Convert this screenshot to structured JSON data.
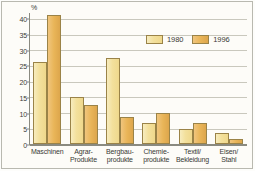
{
  "chart_data": {
    "type": "bar",
    "title": "",
    "xlabel": "",
    "ylabel": "%",
    "unit_label": "%",
    "ylim": [
      0,
      42
    ],
    "yticks": [
      0,
      5,
      10,
      15,
      20,
      25,
      30,
      35,
      40
    ],
    "ytick_labels": [
      "0",
      "5",
      "10",
      "15",
      "20",
      "25",
      "30",
      "35",
      "40"
    ],
    "grid": true,
    "legend_position": "upper-right-inside",
    "categories": [
      "Maschinen",
      "Agrar-\nProdukte",
      "Bergbau-\nprodukte",
      "Chemie-\nprodukte",
      "Textil/\nBekleidung",
      "Eisen/\nStahl"
    ],
    "series": [
      {
        "name": "1980",
        "color": "#F3E09C",
        "values": [
          26.0,
          15.0,
          27.5,
          6.8,
          4.7,
          3.5
        ]
      },
      {
        "name": "1996",
        "color": "#E9B558",
        "values": [
          41.0,
          12.3,
          8.7,
          10.0,
          6.7,
          1.6
        ]
      }
    ]
  },
  "legend": {
    "items": [
      {
        "label": "1980",
        "swatch": "y1980"
      },
      {
        "label": "1996",
        "swatch": "y1996"
      }
    ]
  },
  "colors": {
    "series_1980": "#F3E09C",
    "series_1996": "#E9B558",
    "bar_outline": "#9A8348",
    "gridline": "#C9C8BD",
    "axis": "#8A8A80",
    "text": "#3A3A36",
    "background": "#FDFCF8",
    "frame": "#B9B9B0"
  }
}
